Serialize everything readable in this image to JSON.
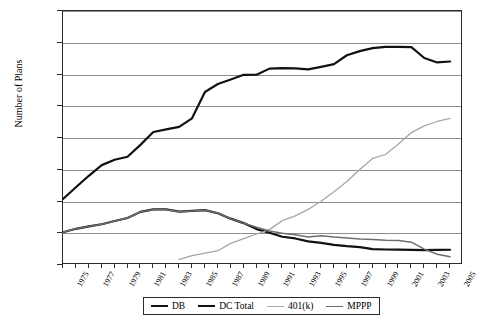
{
  "chart_data": {
    "type": "line",
    "title": "DB, DC, 401(k), and MPPP, 1975-2005",
    "xlabel": "",
    "ylabel": "Number of Plans",
    "xlim": [
      1975,
      2006
    ],
    "ylim": [
      0,
      800000
    ],
    "grid": true,
    "legend_position": "bottom",
    "x": [
      1975,
      1976,
      1977,
      1978,
      1979,
      1980,
      1981,
      1982,
      1983,
      1984,
      1985,
      1986,
      1987,
      1988,
      1989,
      1990,
      1991,
      1992,
      1993,
      1994,
      1995,
      1996,
      1997,
      1998,
      1999,
      2000,
      2001,
      2002,
      2003,
      2004,
      2005
    ],
    "y_ticks": [
      0,
      100000,
      200000,
      300000,
      400000,
      500000,
      600000,
      700000,
      800000
    ],
    "y_tick_labels": [
      "0",
      "100,000",
      "200,000",
      "300,000",
      "400,000",
      "500,000",
      "600,000",
      "700,000",
      "800,000"
    ],
    "x_tick_labels": [
      "1975",
      "1977",
      "1979",
      "1981",
      "1983",
      "1985",
      "1987",
      "1989",
      "1991",
      "1993",
      "1995",
      "1997",
      "1999",
      "2001",
      "2003",
      "2005"
    ],
    "series": [
      {
        "name": "DB",
        "color": "#111111",
        "width": 2.2,
        "values": [
          103346,
          114000,
          121658,
          128401,
          138509,
          148096,
          167293,
          175143,
          175000,
          168000,
          170172,
          172642,
          163065,
          146000,
          132000,
          113062,
          101752,
          88952,
          83596,
          74422,
          69492,
          63657,
          59353,
          56405,
          50037,
          48773,
          48584,
          47950,
          47000,
          47500,
          48000
        ]
      },
      {
        "name": "DC Total",
        "color": "#111111",
        "width": 2.2,
        "values": [
          207748,
          245000,
          281000,
          314592,
          331432,
          340805,
          378280,
          419000,
          427000,
          435000,
          462000,
          545000,
          570000,
          584000,
          599000,
          599245,
          618501,
          620000,
          619000,
          616000,
          623912,
          632566,
          660542,
          673626,
          683100,
          686878,
          687007,
          686000,
          652000,
          638000,
          641000
        ]
      },
      {
        "name": "401(k)",
        "color": "#a6a6a6",
        "width": 1.3,
        "values": [
          null,
          null,
          null,
          null,
          null,
          null,
          null,
          null,
          null,
          17303,
          29869,
          37420,
          45054,
          68121,
          83301,
          97614,
          111394,
          139704,
          154527,
          174945,
          200813,
          230808,
          262814,
          300593,
          335754,
          348043,
          381000,
          417000,
          438000,
          452000,
          462000
        ]
      },
      {
        "name": "MPPP",
        "color": "#6e6e6e",
        "width": 1.5,
        "values": [
          103346,
          114000,
          121658,
          128401,
          138509,
          148096,
          167293,
          175143,
          175000,
          168000,
          170172,
          172642,
          163065,
          146000,
          132000,
          119000,
          107000,
          100000,
          95000,
          88000,
          92000,
          88000,
          85000,
          82000,
          80000,
          78000,
          77000,
          72000,
          50000,
          34000,
          26000
        ]
      }
    ]
  },
  "legend": {
    "items": [
      {
        "label": "DB",
        "color": "#111111",
        "thickness": "2.2px"
      },
      {
        "label": "DC Total",
        "color": "#111111",
        "thickness": "2.2px"
      },
      {
        "label": "401(k)",
        "color": "#a6a6a6",
        "thickness": "1.3px"
      },
      {
        "label": "MPPP",
        "color": "#6e6e6e",
        "thickness": "1.8px"
      }
    ]
  }
}
